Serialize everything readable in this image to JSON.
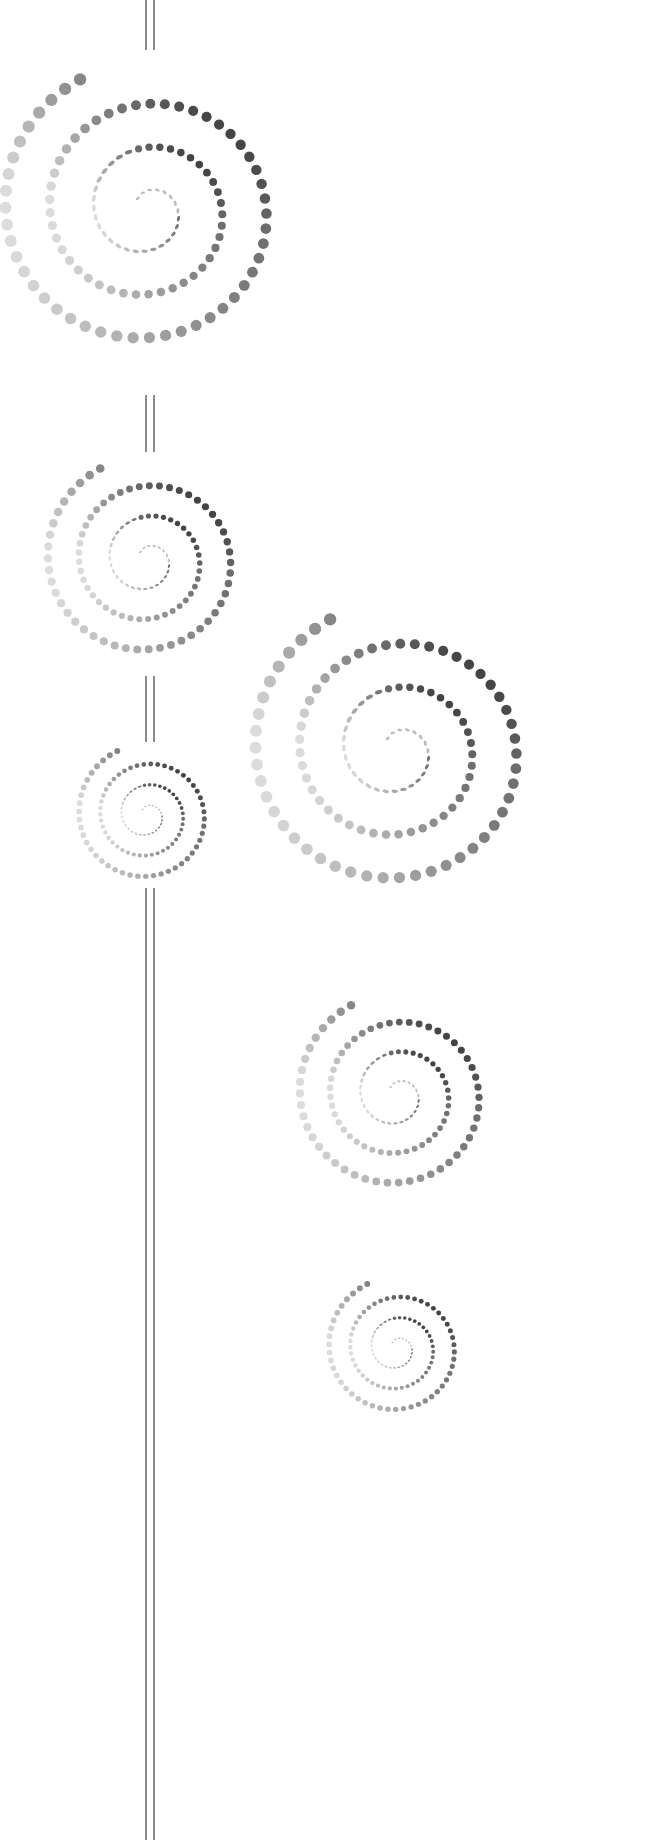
{
  "canvas": {
    "width": 670,
    "height": 1846,
    "background": "#ffffff"
  },
  "palette": {
    "dark": "#1a1a1a",
    "mid": "#6e6e6e",
    "light": "#dcdcdc",
    "line": "#6f6f6f"
  },
  "stem": {
    "x_left": 146,
    "x_right": 154,
    "segments": [
      {
        "y1": 0,
        "y2": 50
      },
      {
        "y1": 395,
        "y2": 452
      },
      {
        "y1": 676,
        "y2": 742
      },
      {
        "y1": 888,
        "y2": 1840
      }
    ]
  },
  "spirals": [
    {
      "name": "spiral-a",
      "cx": 147,
      "cy": 210,
      "r": 150
    },
    {
      "name": "spiral-b",
      "cx": 147,
      "cy": 560,
      "r": 105
    },
    {
      "name": "spiral-c",
      "cx": 147,
      "cy": 815,
      "r": 72
    },
    {
      "name": "spiral-d",
      "cx": 397,
      "cy": 750,
      "r": 150
    },
    {
      "name": "spiral-e",
      "cx": 397,
      "cy": 1095,
      "r": 103
    },
    {
      "name": "spiral-f",
      "cx": 397,
      "cy": 1348,
      "r": 72
    }
  ]
}
